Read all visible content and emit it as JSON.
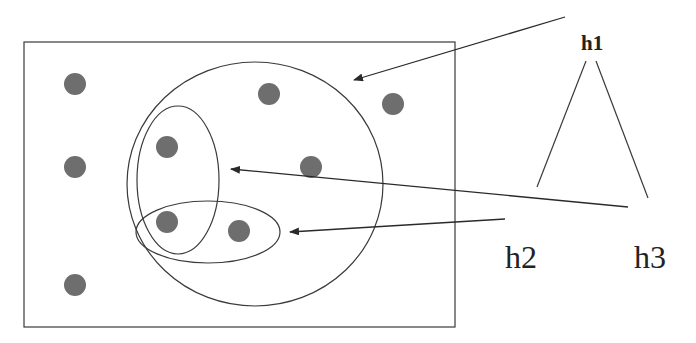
{
  "diagram": {
    "type": "hypothesis-space-venn",
    "colors": {
      "stroke": "#3a3a3a",
      "dot": "#6e6e6e",
      "background": "#ffffff"
    },
    "instance_space": {
      "x": 24,
      "y": 42,
      "width": 431,
      "height": 285
    },
    "regions": [
      {
        "id": "h1",
        "shape": "ellipse",
        "cx": 255,
        "cy": 184,
        "rx": 128,
        "ry": 122
      },
      {
        "id": "h2",
        "shape": "ellipse",
        "cx": 178,
        "cy": 180,
        "rx": 41,
        "ry": 74
      },
      {
        "id": "h3",
        "shape": "ellipse",
        "cx": 208,
        "cy": 232,
        "rx": 72,
        "ry": 31
      }
    ],
    "points": [
      {
        "cx": 75,
        "cy": 84
      },
      {
        "cx": 269,
        "cy": 94
      },
      {
        "cx": 393,
        "cy": 104
      },
      {
        "cx": 167,
        "cy": 147
      },
      {
        "cx": 311,
        "cy": 167
      },
      {
        "cx": 75,
        "cy": 167
      },
      {
        "cx": 167,
        "cy": 222
      },
      {
        "cx": 239,
        "cy": 231
      },
      {
        "cx": 75,
        "cy": 285
      }
    ],
    "arrows": [
      {
        "from_label": "h1",
        "x1": 565,
        "y1": 17,
        "x2": 354,
        "y2": 80
      },
      {
        "from_label": "h2",
        "x1": 628,
        "y1": 207,
        "x2": 231,
        "y2": 169
      },
      {
        "from_label": "h3",
        "x1": 505,
        "y1": 219,
        "x2": 290,
        "y2": 232
      }
    ],
    "tree": {
      "root": "h1",
      "children": [
        "h2",
        "h3"
      ],
      "edges": [
        {
          "x1": 586,
          "y1": 61,
          "x2": 537,
          "y2": 187
        },
        {
          "x1": 596,
          "y1": 61,
          "x2": 648,
          "y2": 198
        }
      ]
    },
    "labels": {
      "h1": "h1",
      "h2": "h2",
      "h3": "h3"
    }
  }
}
